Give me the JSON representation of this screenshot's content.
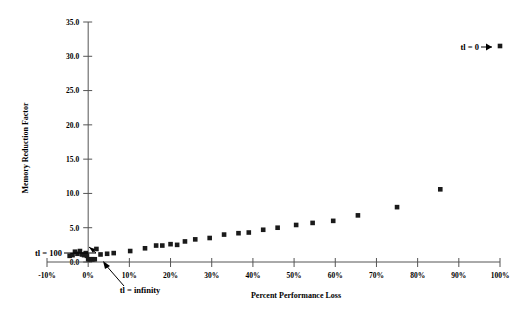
{
  "chart_data": {
    "type": "scatter",
    "title": "",
    "xlabel": "Percent Performance Loss",
    "ylabel": "Memory Reduction Factor",
    "xlim": [
      -10,
      100
    ],
    "ylim": [
      0,
      35
    ],
    "grid": false,
    "legend": "none",
    "xtick_labels": [
      "-10%",
      "0%",
      "10%",
      "20%",
      "30%",
      "40%",
      "50%",
      "60%",
      "70%",
      "80%",
      "90%",
      "100%"
    ],
    "xtick_values": [
      -10,
      0,
      10,
      20,
      30,
      40,
      50,
      60,
      70,
      80,
      90,
      100
    ],
    "ytick_labels": [
      "0.0",
      "5.0",
      "10.0",
      "15.0",
      "20.0",
      "25.0",
      "30.0",
      "35.0"
    ],
    "ytick_values": [
      0,
      5,
      10,
      15,
      20,
      25,
      30,
      35
    ],
    "series": [
      {
        "name": "memory reduction vs performance loss",
        "points": [
          [
            -4.5,
            0.9
          ],
          [
            -3.8,
            1.0
          ],
          [
            -3.2,
            1.5
          ],
          [
            -2.6,
            1.2
          ],
          [
            -2.0,
            1.6
          ],
          [
            -1.5,
            1.1
          ],
          [
            -1.0,
            1.0
          ],
          [
            -0.6,
            1.3
          ],
          [
            -0.3,
            0.9
          ],
          [
            0.0,
            0.4
          ],
          [
            0.4,
            0.4
          ],
          [
            0.8,
            0.4
          ],
          [
            1.2,
            0.4
          ],
          [
            1.6,
            0.4
          ],
          [
            2.0,
            1.9
          ],
          [
            3.0,
            1.1
          ],
          [
            4.6,
            1.2
          ],
          [
            6.2,
            1.3
          ],
          [
            10.2,
            1.6
          ],
          [
            13.8,
            2.0
          ],
          [
            16.5,
            2.4
          ],
          [
            18.0,
            2.4
          ],
          [
            20.0,
            2.6
          ],
          [
            21.6,
            2.5
          ],
          [
            23.5,
            3.0
          ],
          [
            26.0,
            3.3
          ],
          [
            29.5,
            3.5
          ],
          [
            33.0,
            4.0
          ],
          [
            36.5,
            4.2
          ],
          [
            39.0,
            4.3
          ],
          [
            42.5,
            4.7
          ],
          [
            46.0,
            5.0
          ],
          [
            50.5,
            5.4
          ],
          [
            54.5,
            5.7
          ],
          [
            59.5,
            6.0
          ],
          [
            65.5,
            6.8
          ],
          [
            75.0,
            8.0
          ],
          [
            85.5,
            10.6
          ],
          [
            100.0,
            31.5
          ]
        ]
      }
    ],
    "annotations": [
      {
        "id": "tl-zero",
        "text": "tl = 0",
        "points_to": [
          100.0,
          31.5
        ]
      },
      {
        "id": "tl-hundred",
        "text": "tl = 100",
        "points_to": [
          -4.0,
          1.1
        ]
      },
      {
        "id": "tl-infinity",
        "text": "tl = infinity",
        "points_to": [
          0.8,
          0.4
        ]
      }
    ]
  }
}
